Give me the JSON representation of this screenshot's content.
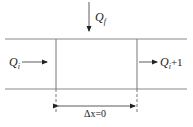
{
  "diagram": {
    "type": "control-volume-flow",
    "labels": {
      "inflow_top": {
        "main": "Q",
        "sub": "f"
      },
      "inflow_left": {
        "main": "Q",
        "sub": "i"
      },
      "outflow_right": {
        "main": "Q",
        "sub": "i",
        "suffix": "+1"
      },
      "dimension": {
        "main": "Δx",
        "suffix": "=0"
      }
    },
    "colors": {
      "line": "#666666",
      "arrow": "#222222",
      "text": "#222222",
      "background": "#ffffff"
    }
  }
}
